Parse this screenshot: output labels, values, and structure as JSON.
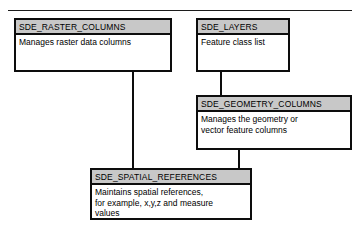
{
  "diagram": {
    "background_color": "#ffffff",
    "line_color": "#0d0d0d",
    "header_fill": "#c8c8c8",
    "body_fill": "#ffffff"
  },
  "entities": [
    {
      "id": "sde-raster-columns",
      "name": "SDE_RASTER_COLUMNS",
      "body_lines": [
        "Manages raster data columns"
      ],
      "x": 14,
      "y": 18,
      "width": 158,
      "height": 54,
      "header_height": 15
    },
    {
      "id": "sde-layers",
      "name": "SDE_LAYERS",
      "body_lines": [
        "Feature class list"
      ],
      "x": 196,
      "y": 18,
      "width": 94,
      "height": 54,
      "header_height": 15
    },
    {
      "id": "sde-geometry-columns",
      "name": "SDE_GEOMETRY_COLUMNS",
      "body_lines": [
        "Manages the geometry or",
        "vector feature columns"
      ],
      "x": 196,
      "y": 95,
      "width": 156,
      "height": 55,
      "header_height": 15
    },
    {
      "id": "sde-spatial-references",
      "name": "SDE_SPATIAL_REFERENCES",
      "body_lines": [
        "Maintains spatial references,",
        "for example, x,y,z and measure",
        "values"
      ],
      "x": 90,
      "y": 168,
      "width": 162,
      "height": 52,
      "header_height": 15
    }
  ],
  "connectors": [
    {
      "id": "raster-to-spatial",
      "from": "sde-raster-columns",
      "to": "sde-spatial-references",
      "orientation": "vertical",
      "x": 132,
      "y": 72,
      "length": 96
    },
    {
      "id": "layers-to-geometry",
      "from": "sde-layers",
      "to": "sde-geometry-columns",
      "orientation": "vertical",
      "x": 220,
      "y": 72,
      "length": 23
    },
    {
      "id": "geometry-to-spatial",
      "from": "sde-geometry-columns",
      "to": "sde-spatial-references",
      "orientation": "vertical",
      "x": 238,
      "y": 150,
      "length": 18
    }
  ]
}
